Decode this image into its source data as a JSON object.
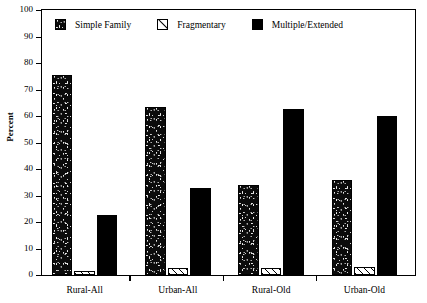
{
  "chart_data": {
    "type": "bar",
    "title": "",
    "subtitle": "",
    "xlabel": "",
    "ylabel": "Percent",
    "ylim": [
      0,
      100
    ],
    "ytick_step": 10,
    "yticks": [
      100,
      90,
      80,
      70,
      60,
      50,
      40,
      30,
      20,
      10,
      0
    ],
    "grid": false,
    "legend_position": "top-left-inside",
    "categories": [
      "Rural-All",
      "Urban-All",
      "Rural-Old",
      "Urban-Old"
    ],
    "series": [
      {
        "name": "Simple Family",
        "pattern": "speckle",
        "color": "#0b0b0b",
        "values": [
          75.5,
          63.5,
          34,
          36
        ]
      },
      {
        "name": "Fragmentary",
        "pattern": "diagonal-hatch",
        "color": "#ffffff",
        "values": [
          1.5,
          2.5,
          2.5,
          3
        ]
      },
      {
        "name": "Multiple/Extended",
        "pattern": "solid",
        "color": "#000000",
        "values": [
          22.5,
          33,
          62.5,
          60
        ]
      }
    ]
  },
  "axis": {
    "y_title": "Percent",
    "y_tick_labels": [
      "100",
      "90",
      "80",
      "70",
      "60",
      "50",
      "40",
      "30",
      "20",
      "10",
      "0"
    ],
    "x_tick_labels": [
      "Rural-All",
      "Urban-All",
      "Rural-Old",
      "Urban-Old"
    ]
  },
  "legend": {
    "items": [
      {
        "label": "Simple Family",
        "swatch": "speckle-swatch"
      },
      {
        "label": "Fragmentary",
        "swatch": "hatch-swatch"
      },
      {
        "label": "Multiple/Extended",
        "swatch": "solid-swatch"
      }
    ]
  }
}
